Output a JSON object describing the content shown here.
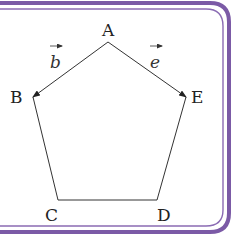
{
  "diagram": {
    "frame_color": "#7b5aa6",
    "vertices": [
      {
        "name": "A",
        "x": 108,
        "y": 42
      },
      {
        "name": "B",
        "x": 33,
        "y": 97
      },
      {
        "name": "C",
        "x": 58,
        "y": 200
      },
      {
        "name": "D",
        "x": 157,
        "y": 200
      },
      {
        "name": "E",
        "x": 186,
        "y": 97
      }
    ],
    "labels": {
      "A": "A",
      "B": "B",
      "C": "C",
      "D": "D",
      "E": "E"
    },
    "vectors": [
      {
        "name": "b",
        "from": "A",
        "to": "B",
        "label": "b"
      },
      {
        "name": "e",
        "from": "A",
        "to": "E",
        "label": "e"
      }
    ]
  }
}
